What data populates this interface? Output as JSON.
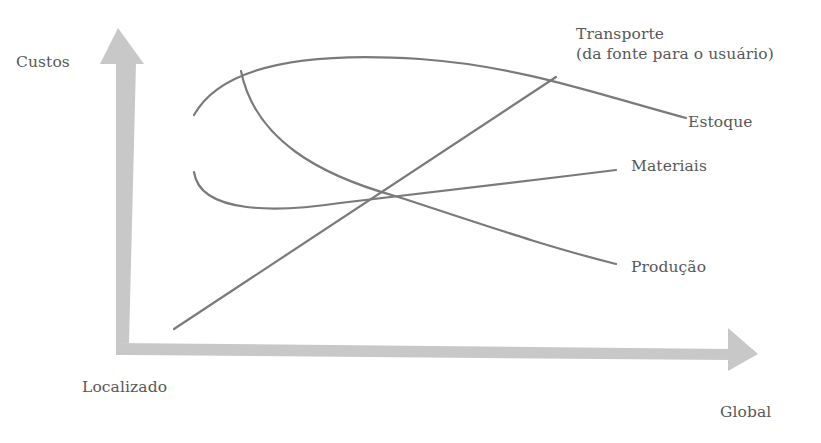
{
  "diagram": {
    "type": "conceptual-cost-curves",
    "axes": {
      "y_label": "Custos",
      "x_origin_label": "Localizado",
      "x_end_label": "Global"
    },
    "curves": [
      {
        "name": "Transporte",
        "label_line1": "Transporte",
        "label_line2": "(da fonte para o usuário)",
        "trend": "increasing"
      },
      {
        "name": "Estoque",
        "label": "Estoque",
        "trend": "rises then falls"
      },
      {
        "name": "Materiais",
        "label": "Materiais",
        "trend": "falls then slowly rises"
      },
      {
        "name": "Produção",
        "label": "Produção",
        "trend": "decreasing"
      }
    ],
    "colors": {
      "axis_fill": "#c8c8c8",
      "curve_stroke": "#7a7a7a",
      "text": "#585858",
      "background": "#ffffff"
    }
  }
}
